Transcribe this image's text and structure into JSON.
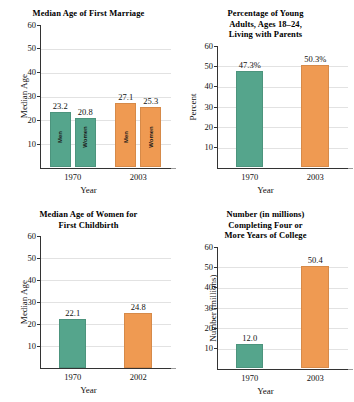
{
  "figure": {
    "panels": [
      "marriage",
      "living_with_parents",
      "childbirth",
      "college"
    ]
  },
  "axis_common": {
    "ticks": [
      "60",
      "50",
      "40",
      "30",
      "20",
      "10"
    ],
    "xlabel": "Year"
  },
  "colors": {
    "green": "#55a58c",
    "orange": "#ef9a52",
    "grid": "#e2e2e2",
    "axis": "#333333",
    "text": "#111111"
  },
  "chart_data": [
    {
      "id": "marriage",
      "type": "bar",
      "title": "Median Age of First Marriage",
      "xlabel": "Year",
      "ylabel": "Median Age",
      "ylim": [
        0,
        60
      ],
      "yticks": [
        10,
        20,
        30,
        40,
        50,
        60
      ],
      "grid": true,
      "categories": [
        "1970",
        "2003"
      ],
      "groups": [
        "Men",
        "Women"
      ],
      "bars": [
        {
          "category": "1970",
          "group": "Men",
          "value": 23.2,
          "label": "23.2",
          "inner_label": "Men",
          "color": "green"
        },
        {
          "category": "1970",
          "group": "Women",
          "value": 20.8,
          "label": "20.8",
          "inner_label": "Women",
          "color": "green"
        },
        {
          "category": "2003",
          "group": "Men",
          "value": 27.1,
          "label": "27.1",
          "inner_label": "Men",
          "color": "orange"
        },
        {
          "category": "2003",
          "group": "Women",
          "value": 25.3,
          "label": "25.3",
          "inner_label": "Women",
          "color": "orange"
        }
      ]
    },
    {
      "id": "living_with_parents",
      "type": "bar",
      "title": "Percentage of Young\nAdults, Ages 18–24,\nLiving with Parents",
      "xlabel": "Year",
      "ylabel": "Percent",
      "ylim": [
        0,
        60
      ],
      "yticks": [
        10,
        20,
        30,
        40,
        50,
        60
      ],
      "grid": true,
      "categories": [
        "1970",
        "2003"
      ],
      "bars": [
        {
          "category": "1970",
          "value": 47.3,
          "label": "47.3%",
          "color": "green"
        },
        {
          "category": "2003",
          "value": 50.3,
          "label": "50.3%",
          "color": "orange"
        }
      ]
    },
    {
      "id": "childbirth",
      "type": "bar",
      "title": "Median Age of Women for\nFirst Childbirth",
      "xlabel": "Year",
      "ylabel": "Median Age",
      "ylim": [
        0,
        60
      ],
      "yticks": [
        10,
        20,
        30,
        40,
        50,
        60
      ],
      "grid": true,
      "categories": [
        "1970",
        "2002"
      ],
      "bars": [
        {
          "category": "1970",
          "value": 22.1,
          "label": "22.1",
          "color": "green"
        },
        {
          "category": "2002",
          "value": 24.8,
          "label": "24.8",
          "color": "orange"
        }
      ]
    },
    {
      "id": "college",
      "type": "bar",
      "title": "Number (in millions)\nCompleting Four or\nMore Years of College",
      "xlabel": "Year",
      "ylabel": "Number (millions)",
      "ylim": [
        0,
        60
      ],
      "yticks": [
        10,
        20,
        30,
        40,
        50,
        60
      ],
      "grid": true,
      "categories": [
        "1970",
        "2003"
      ],
      "bars": [
        {
          "category": "1970",
          "value": 12.0,
          "label": "12.0",
          "color": "green"
        },
        {
          "category": "2003",
          "value": 50.4,
          "label": "50.4",
          "color": "orange"
        }
      ]
    }
  ]
}
